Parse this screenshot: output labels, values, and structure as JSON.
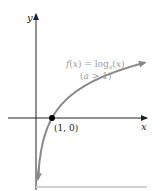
{
  "chart_data": {
    "type": "line",
    "title": "",
    "xlabel": "x",
    "ylabel": "y",
    "series": [
      {
        "name": "f(x) = log_a(x) (a > 1)",
        "function": "log_a(x)",
        "condition": "a > 1"
      }
    ],
    "annotations": [
      {
        "text": "f(x) = log",
        "subscript": "a",
        "suffix": "(x)",
        "line2": "(a > 1)"
      },
      {
        "text": "(1, 0)",
        "point": [
          1,
          0
        ]
      }
    ],
    "highlighted_point": {
      "x": 1,
      "y": 0
    },
    "grid": false
  },
  "colors": {
    "axis": "#222222",
    "curve": "#8a8a8a",
    "label": "#9a9a9a",
    "point": "#000000",
    "rule": "#d0d0d0"
  }
}
